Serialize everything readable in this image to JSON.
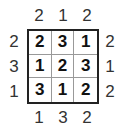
{
  "puzzle": {
    "type": "skyscrapers",
    "size": 3,
    "clues": {
      "top": [
        "2",
        "1",
        "2"
      ],
      "bottom": [
        "1",
        "3",
        "2"
      ],
      "left": [
        "2",
        "3",
        "1"
      ],
      "right": [
        "2",
        "1",
        "2"
      ]
    },
    "grid": [
      [
        "2",
        "3",
        "1"
      ],
      [
        "1",
        "2",
        "3"
      ],
      [
        "3",
        "1",
        "2"
      ]
    ]
  }
}
